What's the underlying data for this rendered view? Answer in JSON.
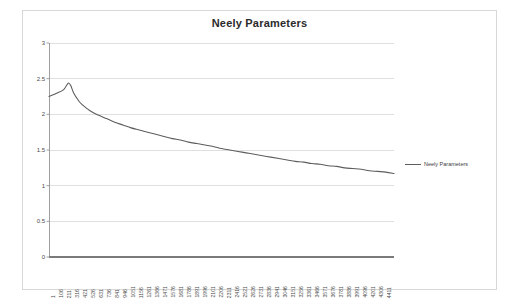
{
  "chart_data": {
    "type": "line",
    "title": "Neely Parameters",
    "xlabel": "",
    "ylabel": "",
    "ylim": [
      0,
      3
    ],
    "yticks": [
      "0",
      "0.5",
      "1",
      "1.5",
      "2",
      "2.5",
      "3"
    ],
    "ytick_values": [
      0,
      0.5,
      1,
      1.5,
      2,
      2.5,
      3
    ],
    "grid": true,
    "legend_position": "right",
    "legend": [
      "Neely Parameters"
    ],
    "line_color": "#5d5d5d",
    "gridline_color": "#c9c9c9",
    "axis_color": "#868686",
    "plot_background": "#ffffff",
    "xtick_labels": [
      "1",
      "106",
      "211",
      "316",
      "421",
      "526",
      "631",
      "736",
      "841",
      "946",
      "1051",
      "1156",
      "1261",
      "1366",
      "1471",
      "1576",
      "1681",
      "1786",
      "1891",
      "1996",
      "2101",
      "2206",
      "2311",
      "2416",
      "2521",
      "2626",
      "2731",
      "2836",
      "2941",
      "3046",
      "3151",
      "3256",
      "3361",
      "3466",
      "3571",
      "3676",
      "3781",
      "3886",
      "3991",
      "4096",
      "4201",
      "4306",
      "4411"
    ],
    "xtick_step": 105,
    "x_min": 1,
    "x_max": 4411,
    "series": [
      {
        "name": "Neely Parameters",
        "x": [
          1,
          106,
          180,
          211,
          250,
          280,
          316,
          380,
          421,
          526,
          631,
          736,
          841,
          946,
          1051,
          1156,
          1261,
          1366,
          1471,
          1576,
          1681,
          1786,
          1891,
          1996,
          2101,
          2206,
          2311,
          2416,
          2521,
          2626,
          2731,
          2836,
          2941,
          3046,
          3151,
          3256,
          3361,
          3466,
          3571,
          3676,
          3781,
          3886,
          3991,
          4096,
          4201,
          4306,
          4411
        ],
        "values": [
          2.25,
          2.3,
          2.34,
          2.38,
          2.44,
          2.4,
          2.3,
          2.19,
          2.14,
          2.05,
          1.99,
          1.94,
          1.89,
          1.85,
          1.81,
          1.78,
          1.75,
          1.72,
          1.69,
          1.66,
          1.64,
          1.61,
          1.59,
          1.57,
          1.55,
          1.52,
          1.5,
          1.48,
          1.46,
          1.44,
          1.42,
          1.4,
          1.38,
          1.36,
          1.34,
          1.33,
          1.31,
          1.3,
          1.28,
          1.27,
          1.25,
          1.24,
          1.23,
          1.21,
          1.2,
          1.19,
          1.17
        ]
      }
    ]
  }
}
